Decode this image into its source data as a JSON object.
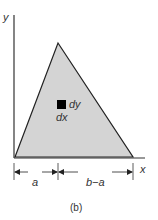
{
  "figure": {
    "caption": "(b)",
    "axes": {
      "x_label": "x",
      "y_label": "y"
    },
    "shape": "triangle",
    "element": {
      "dy_label": "dy",
      "dx_label": "dx"
    },
    "dimensions": {
      "left_label": "a",
      "right_label": "b−a"
    },
    "colors": {
      "fill": "#d4d4d4",
      "stroke": "#222222",
      "element": "#000000"
    }
  }
}
